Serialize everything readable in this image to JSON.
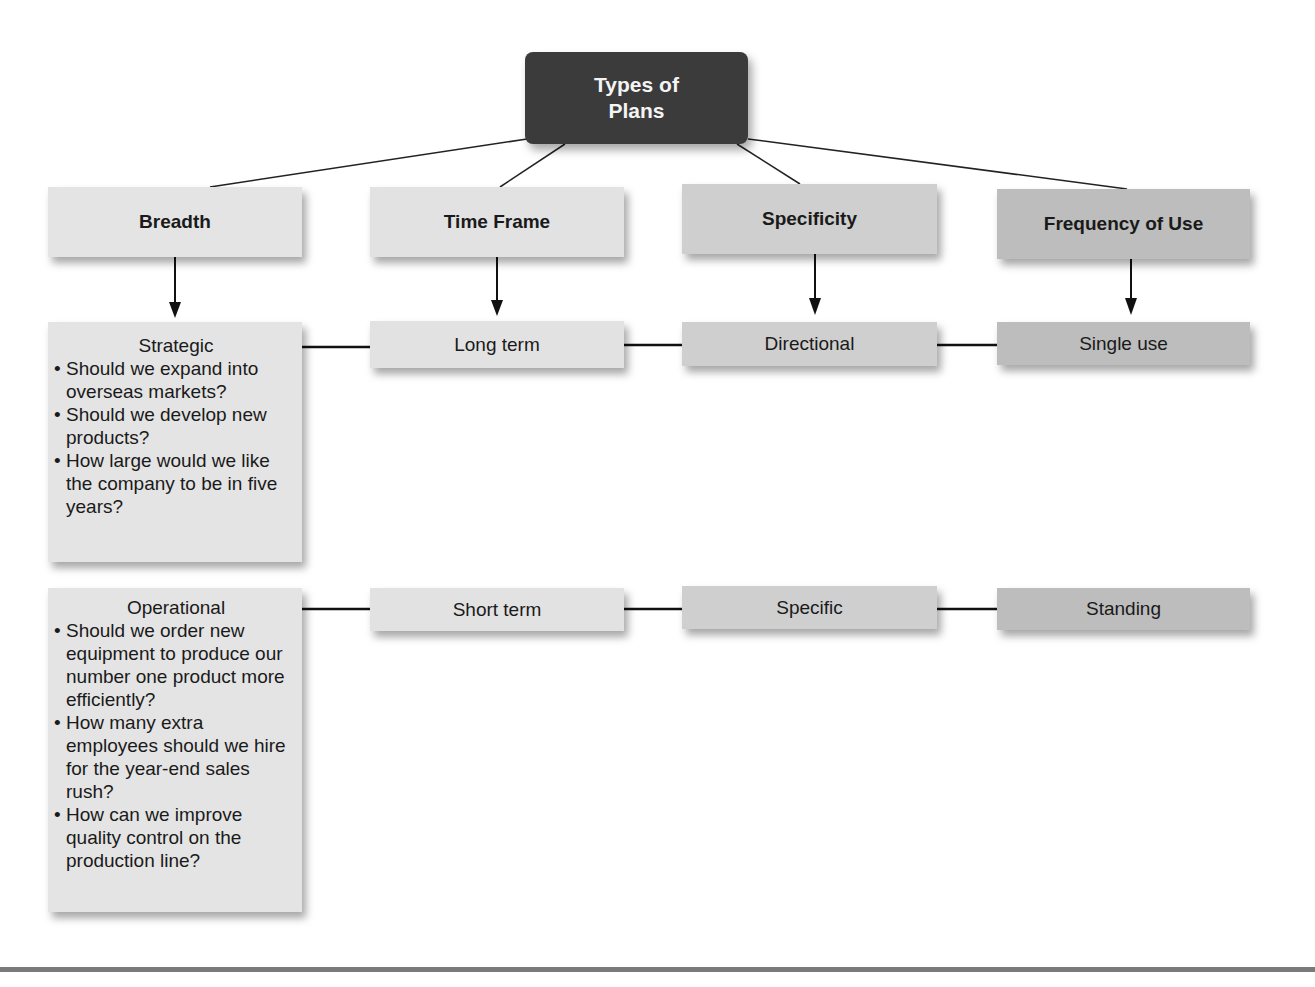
{
  "diagram": {
    "root": {
      "label_line1": "Types of",
      "label_line2": "Plans",
      "color": "#3b3b3b"
    },
    "categories": [
      {
        "label": "Breadth",
        "color": "#e4e4e4"
      },
      {
        "label": "Time Frame",
        "color": "#e2e2e2"
      },
      {
        "label": "Specificity",
        "color": "#cfcfcf"
      },
      {
        "label": "Frequency of Use",
        "color": "#bdbdbd"
      }
    ],
    "row1": {
      "breadth": {
        "title": "Strategic",
        "bullets": [
          "Should we expand into overseas markets?",
          "Should we develop new products?",
          "How large would we like the company to be in five years?"
        ]
      },
      "time_frame": "Long term",
      "specificity": "Directional",
      "frequency": "Single use"
    },
    "row2": {
      "breadth": {
        "title": "Operational",
        "bullets": [
          "Should we order new equipment to produce our number one product more efficiently?",
          "How many extra employees should we hire for the year-end sales rush?",
          "How can we improve quality control on the production line?"
        ]
      },
      "time_frame": "Short term",
      "specificity": "Specific",
      "frequency": "Standing"
    }
  }
}
